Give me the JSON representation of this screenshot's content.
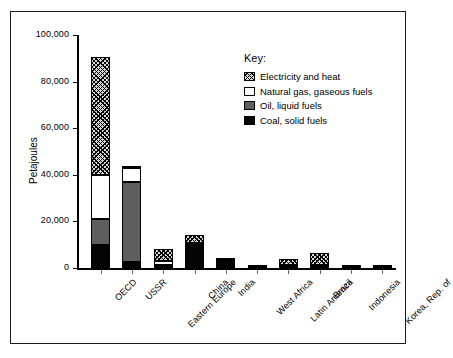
{
  "chart_data": {
    "type": "bar",
    "stacked": true,
    "title": "",
    "xlabel": "",
    "ylabel": "Petajoules",
    "ylim": [
      0,
      100000
    ],
    "yticks": [
      "0",
      "20,000",
      "40,000",
      "60,000",
      "80,000",
      "100,000"
    ],
    "ytick_values": [
      0,
      20000,
      40000,
      60000,
      80000,
      100000
    ],
    "grid": false,
    "legend_position": "top-right",
    "legend_title": "Key:",
    "categories": [
      "OECD",
      "USSR",
      "Eastern Europe",
      "China",
      "India",
      "West Africa",
      "Latin America",
      "Brazil",
      "Indonesia",
      "Korea, Rep. of"
    ],
    "series": [
      {
        "name": "Coal, solid fuels",
        "key": "coal",
        "values": [
          10000,
          2500,
          1000,
          10000,
          3000,
          200,
          300,
          400,
          150,
          200
        ]
      },
      {
        "name": "Oil, liquid fuels",
        "key": "oil",
        "values": [
          11000,
          34500,
          500,
          500,
          300,
          150,
          500,
          600,
          150,
          150
        ]
      },
      {
        "name": "Natural gas, gaseous fuels",
        "key": "gas",
        "values": [
          19000,
          6000,
          1500,
          200,
          100,
          50,
          600,
          300,
          100,
          50
        ]
      },
      {
        "name": "Electricity and heat",
        "key": "elec",
        "values": [
          50500,
          500,
          5000,
          3300,
          200,
          100,
          2600,
          5200,
          100,
          100
        ]
      }
    ],
    "totals": [
      90500,
      43500,
      8000,
      14000,
      3600,
      500,
      4000,
      6500,
      500,
      500
    ]
  }
}
